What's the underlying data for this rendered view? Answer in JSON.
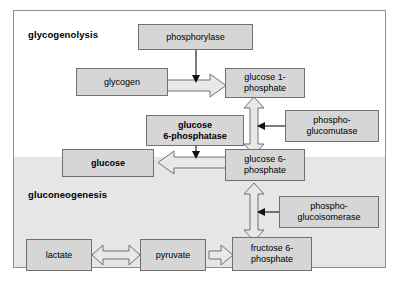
{
  "diagram": {
    "title_regions": [
      {
        "id": "glycogenolysis",
        "label": "glycogenolysis"
      },
      {
        "id": "gluconeogenesis",
        "label": "gluconeogenesis"
      }
    ],
    "nodes": {
      "phosphorylase": "phosphorylase",
      "glycogen": "glycogen",
      "glucose_1_phosphate_l1": "glucose 1-",
      "glucose_1_phosphate_l2": "phosphate",
      "phosphoglucomutase_l1": "phospho-",
      "phosphoglucomutase_l2": "glucomutase",
      "glucose_6_phosphatase_l1": "glucose",
      "glucose_6_phosphatase_l2": "6-phosphatase",
      "glucose": "glucose",
      "glucose_6_phosphate_l1": "glucose 6-",
      "glucose_6_phosphate_l2": "phosphate",
      "phosphoglucoisomerase_l1": "phospho-",
      "phosphoglucoisomerase_l2": "glucoisomerase",
      "lactate": "lactate",
      "pyruvate": "pyruvate",
      "fructose_6_phosphate_l1": "fructose 6-",
      "fructose_6_phosphate_l2": "phosphate"
    },
    "colors": {
      "box_fill": "#d6d6d6",
      "box_stroke": "#707070",
      "arrow_fill": "#e8e8e8",
      "band_fill": "#e6e6e6",
      "frame_stroke": "#8f8f8f",
      "text": "#000000"
    },
    "edges": [
      {
        "from": "glycogen",
        "to": "glucose_1_phosphate",
        "style": "block-arrow-right"
      },
      {
        "from": "phosphorylase",
        "to": "glycogen-to-g1p-arrow",
        "style": "thin-arrow-down"
      },
      {
        "from": "glucose_1_phosphate",
        "to": "glucose_6_phosphate",
        "style": "block-arrow-updown"
      },
      {
        "from": "phosphoglucomutase",
        "to": "g1p-g6p-arrow",
        "style": "thin-arrow-left"
      },
      {
        "from": "glucose_6_phosphate",
        "to": "glucose",
        "style": "block-arrow-left"
      },
      {
        "from": "glucose_6_phosphatase",
        "to": "g6p-glucose-arrow",
        "style": "thin-arrow-down"
      },
      {
        "from": "glucose_6_phosphate",
        "to": "fructose_6_phosphate",
        "style": "block-arrow-updown"
      },
      {
        "from": "phosphoglucoisomerase",
        "to": "g6p-f6p-arrow",
        "style": "thin-arrow-left"
      },
      {
        "from": "lactate",
        "to": "pyruvate",
        "style": "block-arrow-leftright"
      },
      {
        "from": "pyruvate",
        "to": "fructose_6_phosphate",
        "style": "block-arrow-right-double"
      }
    ]
  }
}
